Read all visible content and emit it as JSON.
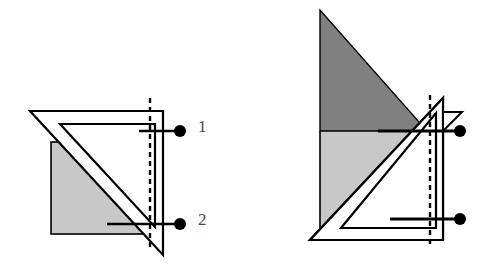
{
  "figure": {
    "width": 492,
    "height": 277,
    "background": "#ffffff",
    "colors": {
      "stroke": "#000000",
      "light_gray_fill": "#c8c8c8",
      "dark_gray_fill": "#808080",
      "white_fill": "#ffffff",
      "label_text": "#4a4a4a",
      "marker_dot": "#000000"
    },
    "labels": [
      {
        "id": "1",
        "text": "1",
        "x": 198,
        "y": 118
      },
      {
        "id": "2",
        "text": "2",
        "x": 198,
        "y": 211
      }
    ],
    "panels": [
      {
        "name": "left-panel",
        "shapes": {
          "gray_square": {
            "fill": "#c8c8c8",
            "x": 51,
            "y": 142,
            "width": 93,
            "height": 92
          },
          "outer_triangle": {
            "fill": "#ffffff",
            "points": "30,111 163,111 163,255"
          },
          "inner_triangle": {
            "fill": "#ffffff",
            "points": "60,124 155,124 155,227"
          },
          "dashed_line": {
            "x": 150,
            "y1": 98,
            "y2": 248,
            "dash": "5,4"
          },
          "leader_line_1": {
            "x1": 139,
            "y1": 131,
            "x2": 178,
            "y2": 131
          },
          "leader_line_2": {
            "x1": 107,
            "y1": 224,
            "x2": 178,
            "y2": 224
          },
          "dot_1": {
            "cx": 180,
            "cy": 131,
            "r": 6
          },
          "dot_2": {
            "cx": 180,
            "cy": 224,
            "r": 6
          }
        }
      },
      {
        "name": "right-panel",
        "shapes": {
          "dark_triangle": {
            "fill": "#808080",
            "points": "320,10 320,131 427,131"
          },
          "light_region": {
            "fill": "#c8c8c8",
            "x": 320,
            "y": 131,
            "width": 107,
            "height": 104
          },
          "outer_triangle": {
            "fill": "#ffffff",
            "points": "443,98 443,240 310,240"
          },
          "inner_triangle": {
            "fill": "#ffffff",
            "points": "436,113 436,228 341,228"
          },
          "small_flag_triangle": {
            "fill": "#ffffff",
            "points": "443,112 462,112 443,131"
          },
          "dashed_line": {
            "x": 430,
            "y1": 95,
            "y2": 248,
            "dash": "5,4"
          },
          "leader_line_1": {
            "x1": 378,
            "y1": 131,
            "x2": 458,
            "y2": 131
          },
          "leader_line_2": {
            "x1": 390,
            "y1": 219,
            "x2": 458,
            "y2": 219
          },
          "dot_1": {
            "cx": 460,
            "cy": 131,
            "r": 6
          },
          "dot_2": {
            "cx": 460,
            "cy": 219,
            "r": 6
          }
        }
      }
    ]
  }
}
